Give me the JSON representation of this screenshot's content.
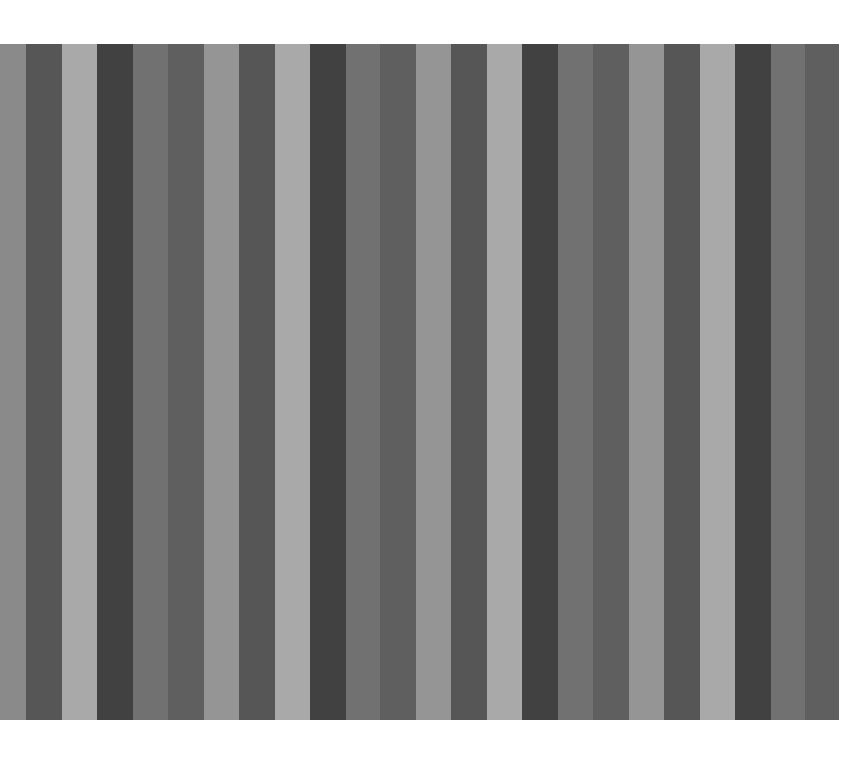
{
  "image": {
    "width": 859,
    "height": 757,
    "background": "#ffffff",
    "panel": {
      "left": 0,
      "top": 44,
      "right": 839,
      "bottom": 720
    }
  },
  "palette": {
    "mid": "#8a8a8a",
    "dark": "#565656",
    "light": "#a9a9a9",
    "darkest": "#414141",
    "mid2": "#717171",
    "darkmid": "#5f5f5f",
    "lightmid": "#959595"
  },
  "stripes": [
    {
      "x0": 0,
      "x1": 26,
      "tone": "mid"
    },
    {
      "x0": 26,
      "x1": 62,
      "tone": "dark"
    },
    {
      "x0": 62,
      "x1": 97,
      "tone": "light"
    },
    {
      "x0": 97,
      "x1": 133,
      "tone": "darkest"
    },
    {
      "x0": 133,
      "x1": 168,
      "tone": "mid2"
    },
    {
      "x0": 168,
      "x1": 204,
      "tone": "darkmid"
    },
    {
      "x0": 204,
      "x1": 239,
      "tone": "lightmid"
    },
    {
      "x0": 239,
      "x1": 275,
      "tone": "dark"
    },
    {
      "x0": 275,
      "x1": 310,
      "tone": "light"
    },
    {
      "x0": 310,
      "x1": 346,
      "tone": "darkest"
    },
    {
      "x0": 346,
      "x1": 380,
      "tone": "mid2"
    },
    {
      "x0": 380,
      "x1": 416,
      "tone": "darkmid"
    },
    {
      "x0": 416,
      "x1": 451,
      "tone": "lightmid"
    },
    {
      "x0": 451,
      "x1": 487,
      "tone": "dark"
    },
    {
      "x0": 487,
      "x1": 522,
      "tone": "light"
    },
    {
      "x0": 522,
      "x1": 558,
      "tone": "darkest"
    },
    {
      "x0": 558,
      "x1": 593,
      "tone": "mid2"
    },
    {
      "x0": 593,
      "x1": 629,
      "tone": "darkmid"
    },
    {
      "x0": 629,
      "x1": 664,
      "tone": "lightmid"
    },
    {
      "x0": 664,
      "x1": 700,
      "tone": "dark"
    },
    {
      "x0": 700,
      "x1": 735,
      "tone": "light"
    },
    {
      "x0": 735,
      "x1": 771,
      "tone": "darkest"
    },
    {
      "x0": 771,
      "x1": 805,
      "tone": "mid2"
    },
    {
      "x0": 805,
      "x1": 839,
      "tone": "darkmid"
    }
  ]
}
